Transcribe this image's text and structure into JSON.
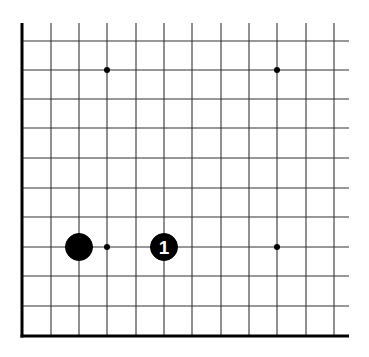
{
  "diagram": {
    "type": "go-board-corner",
    "colors": {
      "background": "#ffffff",
      "line": "#333333",
      "edge": "#000000",
      "stone_black": "#000000",
      "label_on_black": "#ffffff"
    },
    "grid": {
      "x_lines": [
        22,
        51,
        79,
        107,
        136,
        164,
        192,
        221,
        249,
        277,
        306,
        334
      ],
      "y_lines": [
        41,
        70,
        99,
        128,
        158,
        188,
        217,
        247,
        276,
        306,
        336
      ],
      "top_extent": 23,
      "right_extent": 349,
      "edges": [
        "left",
        "bottom"
      ]
    },
    "star_points": [
      {
        "x": 107,
        "y": 70
      },
      {
        "x": 277,
        "y": 70
      },
      {
        "x": 107,
        "y": 247
      },
      {
        "x": 277,
        "y": 247
      }
    ],
    "stones": [
      {
        "color": "black",
        "x": 79,
        "y": 247,
        "label": ""
      },
      {
        "color": "black",
        "x": 164,
        "y": 247,
        "label": "1"
      }
    ]
  }
}
